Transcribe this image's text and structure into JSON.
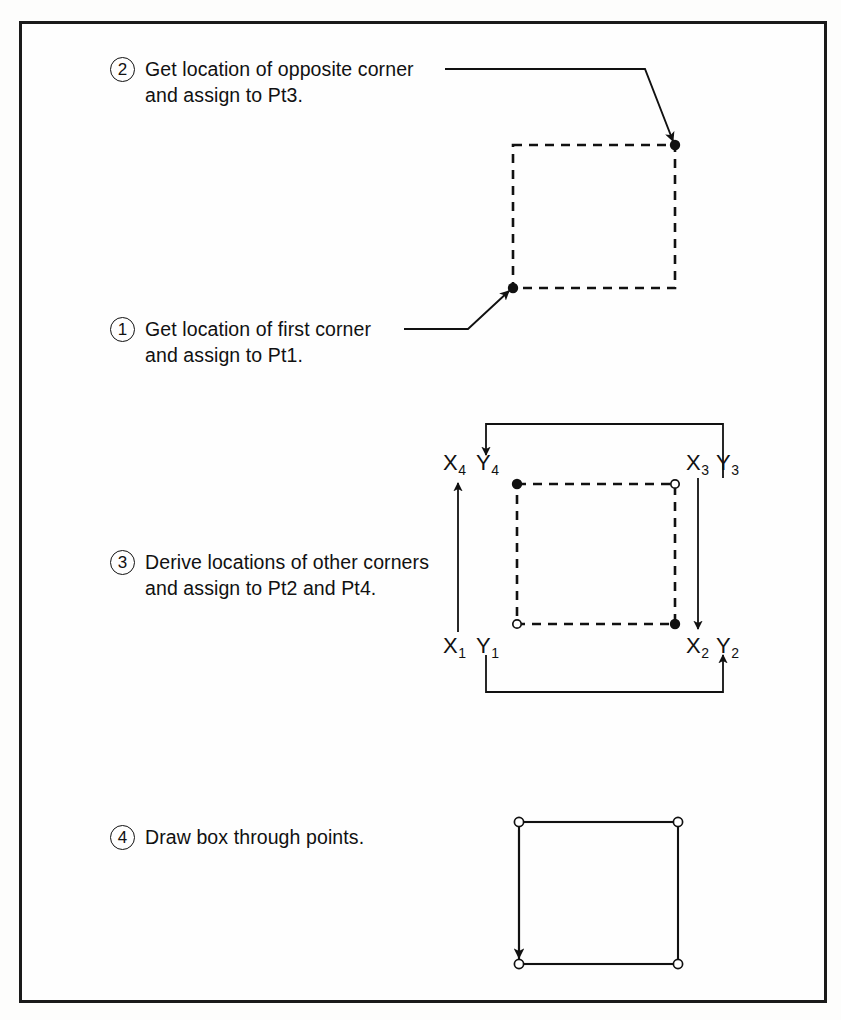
{
  "page": {
    "background_color": "#fdfdfc",
    "frame_color": "#1a1a1a",
    "ink_color": "#111111"
  },
  "steps": [
    {
      "number": "1",
      "text": "Get location of first corner\nand assign to Pt1."
    },
    {
      "number": "2",
      "text": "Get location of opposite corner\nand assign to Pt3."
    },
    {
      "number": "3",
      "text": "Derive locations of other corners\nand assign to Pt2 and Pt4."
    },
    {
      "number": "4",
      "text": "Draw box through points."
    }
  ],
  "coordinate_labels": [
    {
      "id": "x4",
      "axis": "X",
      "index": "4"
    },
    {
      "id": "y4",
      "axis": "Y",
      "index": "4"
    },
    {
      "id": "x3",
      "axis": "X",
      "index": "3"
    },
    {
      "id": "y3",
      "axis": "Y",
      "index": "3"
    },
    {
      "id": "x1",
      "axis": "X",
      "index": "1"
    },
    {
      "id": "y1",
      "axis": "Y",
      "index": "1"
    },
    {
      "id": "x2",
      "axis": "X",
      "index": "2"
    },
    {
      "id": "y2",
      "axis": "Y",
      "index": "2"
    }
  ],
  "figures": {
    "upper_box": {
      "style": "dashed",
      "corners": [
        {
          "name": "pt1-corner",
          "marker": "filled-dot"
        },
        {
          "name": "pt3-corner",
          "marker": "filled-dot"
        }
      ]
    },
    "middle_box": {
      "style": "dashed",
      "corners": [
        {
          "name": "pt4-corner",
          "marker": "filled-dot"
        },
        {
          "name": "pt3-corner",
          "marker": "open-circle"
        },
        {
          "name": "pt1-corner",
          "marker": "open-circle"
        },
        {
          "name": "pt2-corner",
          "marker": "filled-dot"
        }
      ]
    },
    "lower_box": {
      "style": "solid",
      "corners": [
        {
          "name": "corner",
          "marker": "open-circle"
        },
        {
          "name": "corner",
          "marker": "open-circle"
        },
        {
          "name": "corner",
          "marker": "open-circle"
        },
        {
          "name": "corner",
          "marker": "open-circle"
        }
      ]
    }
  }
}
